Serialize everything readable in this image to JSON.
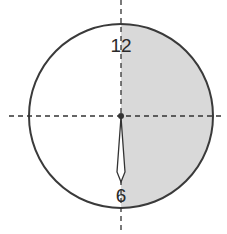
{
  "diagram": {
    "type": "clock-face",
    "labels": {
      "top": "12",
      "bottom": "6"
    },
    "hand": {
      "points_to": "6"
    },
    "shaded_region": "right half (12 to 6, clockwise)",
    "colors": {
      "outline": "#3a3a3a",
      "shade": "#d9d9d9",
      "dashed_axes": "#333333",
      "hand_fill": "#ffffff"
    }
  }
}
